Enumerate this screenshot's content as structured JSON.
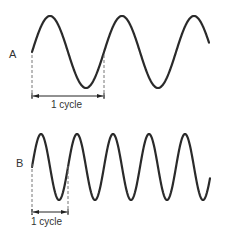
{
  "diagram": {
    "waves": [
      {
        "id": "A",
        "label": "A",
        "cycle_label": "1 cycle",
        "cycles_shown": 2.5,
        "relative_frequency": 1
      },
      {
        "id": "B",
        "label": "B",
        "cycle_label": "1 cycle",
        "cycles_shown": 5,
        "relative_frequency": 2
      }
    ],
    "colors": {
      "wave": "#2a2a2a",
      "dashed_guides": "#777777",
      "text": "#333333"
    }
  }
}
